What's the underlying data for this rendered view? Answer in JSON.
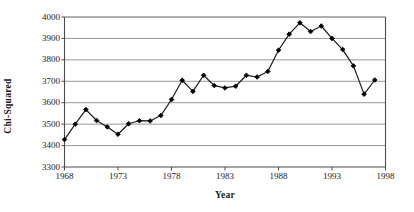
{
  "chart_data": {
    "type": "line",
    "title": "",
    "xlabel": "Year",
    "ylabel": "Chi-Squared",
    "xlim": [
      1968,
      1998
    ],
    "ylim": [
      3300,
      4000
    ],
    "xticks": [
      1968,
      1973,
      1978,
      1983,
      1988,
      1993,
      1998
    ],
    "yticks": [
      3300,
      3400,
      3500,
      3600,
      3700,
      3800,
      3900,
      4000
    ],
    "grid": "horizontal",
    "legend": "none",
    "marker": "filled-diamond",
    "line_color": "#1a1a1a",
    "marker_color": "#000000",
    "grid_color": "#8c8c8c",
    "axis_color": "#4d4d4d",
    "x": [
      1968,
      1969,
      1970,
      1971,
      1972,
      1973,
      1974,
      1975,
      1976,
      1977,
      1978,
      1979,
      1980,
      1981,
      1982,
      1983,
      1984,
      1985,
      1986,
      1987,
      1988,
      1989,
      1990,
      1991,
      1992,
      1993,
      1994,
      1995,
      1996,
      1997
    ],
    "values": [
      3428,
      3500,
      3568,
      3517,
      3487,
      3453,
      3502,
      3516,
      3515,
      3540,
      3615,
      3705,
      3653,
      3728,
      3680,
      3669,
      3677,
      3728,
      3720,
      3746,
      3845,
      3920,
      3973,
      3932,
      3958,
      3900,
      3848,
      3772,
      3640,
      3706
    ],
    "series": [
      {
        "name": "Chi-Squared",
        "values": [
          3428,
          3500,
          3568,
          3517,
          3487,
          3453,
          3502,
          3516,
          3515,
          3540,
          3615,
          3705,
          3653,
          3728,
          3680,
          3669,
          3677,
          3728,
          3720,
          3746,
          3845,
          3920,
          3973,
          3932,
          3958,
          3900,
          3848,
          3772,
          3640,
          3706
        ]
      }
    ]
  },
  "axes": {
    "y_tick_labels": [
      "4000",
      "3900",
      "3800",
      "3700",
      "3600",
      "3500",
      "3400",
      "3300"
    ],
    "x_tick_labels": [
      "1968",
      "1973",
      "1978",
      "1983",
      "1988",
      "1993",
      "1998"
    ],
    "y_axis_title": "Chi-Squared",
    "x_axis_title": "Year"
  }
}
